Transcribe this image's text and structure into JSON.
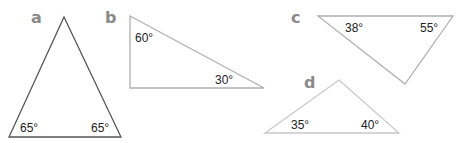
{
  "triangles": [
    {
      "label": "a",
      "angles": [
        "65°",
        "65°"
      ],
      "stroke": "#555555"
    },
    {
      "label": "b",
      "angles": [
        "60°",
        "30°"
      ],
      "stroke": "#b0b0b0"
    },
    {
      "label": "c",
      "angles": [
        "38°",
        "55°"
      ],
      "stroke": "#b0b0b0"
    },
    {
      "label": "d",
      "angles": [
        "35°",
        "40°"
      ],
      "stroke": "#c8c8c8"
    }
  ]
}
